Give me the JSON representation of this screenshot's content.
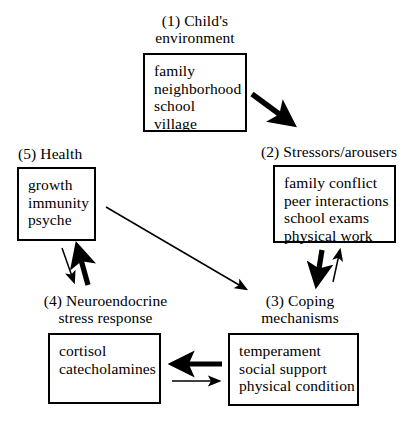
{
  "diagram": {
    "width": 414,
    "height": 423,
    "background_color": "#ffffff",
    "stroke_color": "#000000",
    "nodes": [
      {
        "id": "1",
        "label": "(1) Child's\nenvironment",
        "items": "family\nneighborhood\nschool\nvillage"
      },
      {
        "id": "2",
        "label": "(2) Stressors/arousers",
        "items": "family conflict\npeer interactions\nschool exams\nphysical work"
      },
      {
        "id": "3",
        "label": "(3) Coping\nmechanisms",
        "items": "temperament\nsocial support\nphysical condition"
      },
      {
        "id": "4",
        "label": "(4) Neuroendocrine\nstress response",
        "items": "cortisol\ncatecholamines"
      },
      {
        "id": "5",
        "label": "(5) Health",
        "items": "growth\nimmunity\npsyche"
      }
    ],
    "arrows": [
      {
        "name": "child-environment-to-stressors",
        "from": "1",
        "to": "2",
        "weight": "thick",
        "direction": "down-right"
      },
      {
        "name": "stressors-to-coping",
        "from": "2",
        "to": "3",
        "weight": "thick",
        "direction": "down"
      },
      {
        "name": "coping-to-stressors",
        "from": "3",
        "to": "2",
        "weight": "thin",
        "direction": "up"
      },
      {
        "name": "coping-to-neuroendocrine",
        "from": "3",
        "to": "4",
        "weight": "thick",
        "direction": "left"
      },
      {
        "name": "neuroendocrine-to-coping",
        "from": "4",
        "to": "3",
        "weight": "thin",
        "direction": "right"
      },
      {
        "name": "neuroendocrine-to-health",
        "from": "4",
        "to": "5",
        "weight": "thick",
        "direction": "up-right"
      },
      {
        "name": "health-to-neuroendocrine",
        "from": "5",
        "to": "4",
        "weight": "thin",
        "direction": "down-left"
      },
      {
        "name": "health-to-coping",
        "from": "5",
        "to": "3",
        "weight": "thin",
        "direction": "down-right"
      }
    ]
  }
}
